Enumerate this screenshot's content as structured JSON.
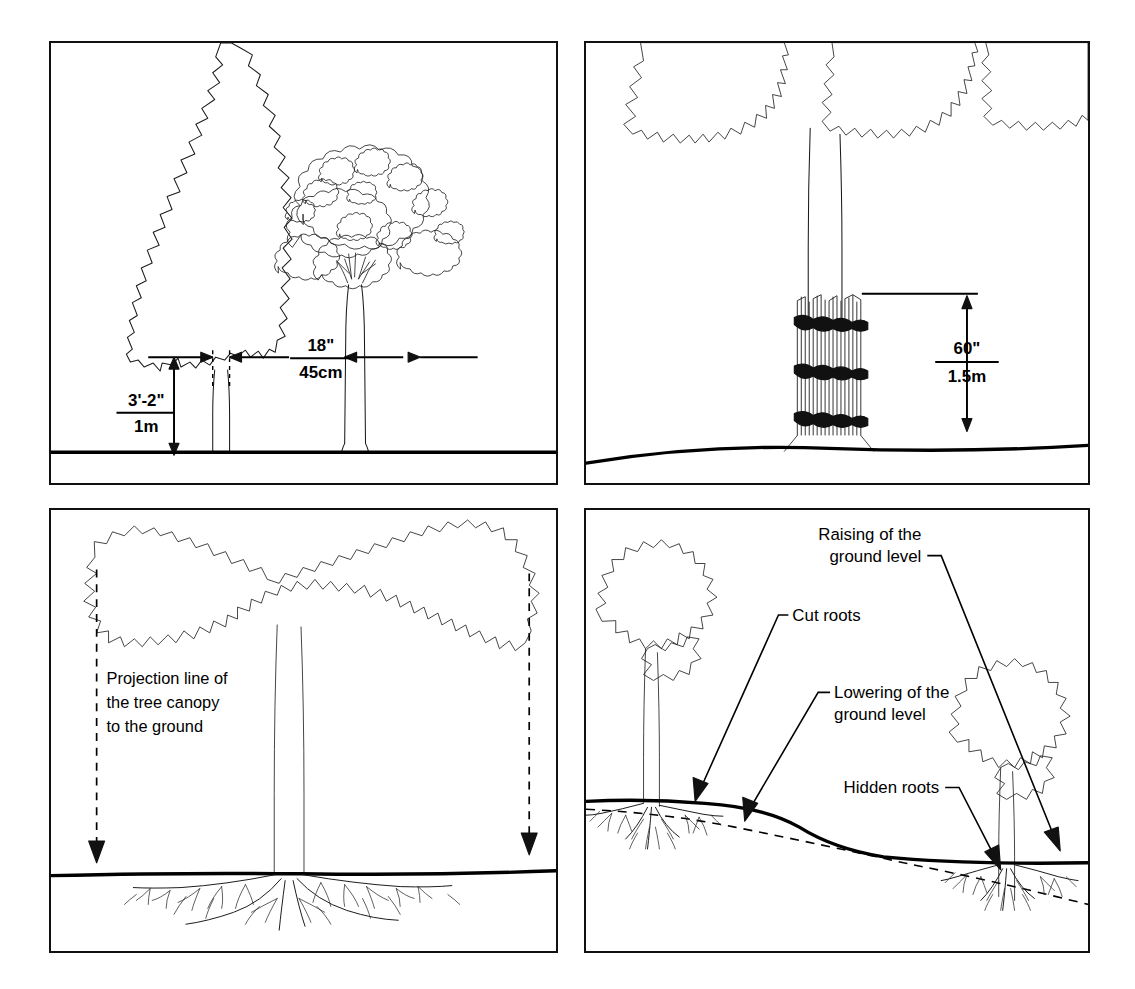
{
  "sheet": {
    "background": "#ffffff",
    "ink": "#111111",
    "panel_count": 4
  },
  "panels": [
    {
      "id": "panel-1",
      "name": "tree-spacing-clearance",
      "position": "top-left",
      "dimensions": [
        {
          "name": "trunk-clear-height",
          "imperial": "3'-2\"",
          "metric": "1m",
          "orientation": "vertical"
        },
        {
          "name": "crown-clearance-gap",
          "imperial": "18\"",
          "metric": "45cm",
          "orientation": "horizontal"
        }
      ],
      "elements": [
        "columnar-conifer-tree",
        "deciduous-broadleaf-tree",
        "ground-line"
      ]
    },
    {
      "id": "panel-2",
      "name": "trunk-slat-protection",
      "position": "top-right",
      "dimensions": [
        {
          "name": "protection-height",
          "imperial": "60\"",
          "metric": "1.5m",
          "orientation": "vertical"
        }
      ],
      "elements": [
        "tree-trunk",
        "vertical-timber-slats",
        "binding-ties",
        "sloped-ground-line"
      ],
      "tie_count": 3
    },
    {
      "id": "panel-3",
      "name": "canopy-projection-root-zone",
      "position": "bottom-left",
      "note": {
        "lines": [
          "Projection line of",
          "the tree canopy",
          "to the ground"
        ]
      },
      "elements": [
        "tree-canopy-outline",
        "trunk",
        "dashed-projection-lines",
        "projection-arrows",
        "ground-line",
        "root-plate"
      ]
    },
    {
      "id": "panel-4",
      "name": "ground-level-change-effects",
      "position": "bottom-right",
      "callouts": [
        {
          "name": "raising-ground-level",
          "lines": [
            "Raising of the",
            "ground level"
          ]
        },
        {
          "name": "cut-roots",
          "lines": [
            "Cut roots"
          ]
        },
        {
          "name": "lowering-ground-level",
          "lines": [
            "Lowering of the",
            "ground level"
          ]
        },
        {
          "name": "hidden-roots",
          "lines": [
            "Hidden roots"
          ]
        }
      ],
      "elements": [
        "left-tree",
        "right-tree",
        "new-ground-profile-solid",
        "original-ground-profile-dashed",
        "root-systems"
      ]
    }
  ]
}
